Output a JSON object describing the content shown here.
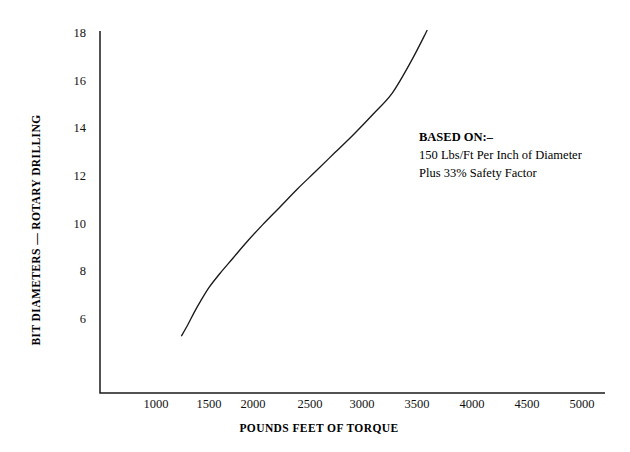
{
  "chart_data": {
    "type": "line",
    "title": "",
    "xlabel": "POUNDS FEET OF TORQUE",
    "ylabel": "BIT DIAMETERS — ROTARY DRILLING",
    "xlim": [
      750,
      5220
    ],
    "ylim": [
      4.7,
      18.6
    ],
    "grid": false,
    "legend": null,
    "xticks": [
      1000,
      1500,
      2000,
      2500,
      3000,
      3500,
      4000,
      4500,
      5000
    ],
    "xtick_labels": [
      "1000",
      "1500",
      "2000",
      "2500",
      "3000",
      "3500",
      "4000",
      "4500",
      "5000"
    ],
    "yticks": [
      6,
      8,
      10,
      12,
      14,
      16,
      18
    ],
    "ytick_labels": [
      "6",
      "8",
      "10",
      "12",
      "14",
      "16",
      "18"
    ],
    "series": [
      {
        "name": "Torque vs Bit Diameter",
        "x": [
          1240,
          1300,
          1360,
          1420,
          1500,
          1600,
          1720,
          1850,
          2000,
          2160,
          2330,
          2500,
          2680,
          2860,
          3040,
          3220,
          3400,
          3545
        ],
        "y": [
          5.85,
          6.3,
          6.8,
          7.25,
          7.8,
          8.35,
          8.95,
          9.6,
          10.3,
          11.0,
          11.75,
          12.45,
          13.2,
          13.95,
          14.75,
          15.6,
          16.9,
          18.1
        ]
      }
    ],
    "annotations": [
      {
        "name": "based-on-note",
        "x": 3580,
        "y": 14.3,
        "lines": [
          "BASED ON:–",
          "150 Lbs/Ft Per Inch of Diameter",
          "Plus 33% Safety Factor"
        ]
      }
    ]
  },
  "axis": {
    "x_title": "POUNDS FEET OF TORQUE",
    "y_title": "BIT DIAMETERS — ROTARY DRILLING"
  },
  "annotation": {
    "line1": "BASED ON:–",
    "line2": "150 Lbs/Ft Per Inch of Diameter",
    "line3": "Plus 33% Safety Factor"
  },
  "ticks": {
    "x": [
      "1000",
      "1500",
      "2000",
      "2500",
      "3000",
      "3500",
      "4000",
      "4500",
      "5000"
    ],
    "y": [
      "18",
      "16",
      "14",
      "12",
      "10",
      "8",
      "6"
    ]
  },
  "colors": {
    "ink": "#1a1a1a",
    "background": "#ffffff"
  }
}
